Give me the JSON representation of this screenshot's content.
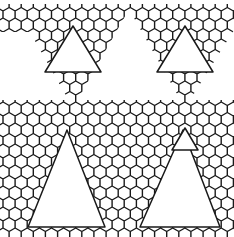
{
  "figure": {
    "width": 234,
    "height": 237,
    "stroke_color": "#1a1a1a",
    "background": "#ffffff"
  },
  "tiling": {
    "hex_side": 7,
    "origin_x": 3,
    "origin_y": 4,
    "regions": [
      {
        "name": "top-left-inverted-patch",
        "points": [
          [
            14,
            4
          ],
          [
            132,
            4
          ],
          [
            73,
            108
          ]
        ]
      },
      {
        "name": "top-right-inverted-patch",
        "points": [
          [
            126,
            4
          ],
          [
            234,
            4
          ],
          [
            234,
            30
          ],
          [
            185,
            108
          ]
        ]
      },
      {
        "name": "left-edge-strip-top",
        "points": [
          [
            0,
            4
          ],
          [
            14,
            4
          ],
          [
            30,
            32
          ],
          [
            0,
            32
          ]
        ]
      },
      {
        "name": "middle-band",
        "points": [
          [
            0,
            100
          ],
          [
            234,
            100
          ],
          [
            234,
            150
          ],
          [
            0,
            150
          ]
        ]
      },
      {
        "name": "bottom-left-frame",
        "points": [
          [
            0,
            120
          ],
          [
            125,
            120
          ],
          [
            125,
            237
          ],
          [
            0,
            237
          ]
        ]
      },
      {
        "name": "bottom-right-frame",
        "points": [
          [
            125,
            120
          ],
          [
            234,
            120
          ],
          [
            234,
            237
          ],
          [
            125,
            237
          ]
        ]
      }
    ],
    "large_triangles": [
      {
        "name": "upper-left-triangle",
        "points": [
          [
            73,
            26
          ],
          [
            45,
            72
          ],
          [
            101,
            72
          ]
        ]
      },
      {
        "name": "upper-right-triangle",
        "points": [
          [
            185,
            26
          ],
          [
            157,
            72
          ],
          [
            213,
            72
          ]
        ]
      },
      {
        "name": "lower-left-triangle",
        "points": [
          [
            67,
            130
          ],
          [
            28,
            227
          ],
          [
            105,
            227
          ]
        ]
      },
      {
        "name": "lower-right-triangle",
        "points": [
          [
            183,
            130
          ],
          [
            140,
            227
          ],
          [
            220,
            227
          ]
        ]
      },
      {
        "name": "small-right-triangle",
        "points": [
          [
            185,
            128
          ],
          [
            172,
            150
          ],
          [
            198,
            150
          ]
        ]
      }
    ]
  }
}
